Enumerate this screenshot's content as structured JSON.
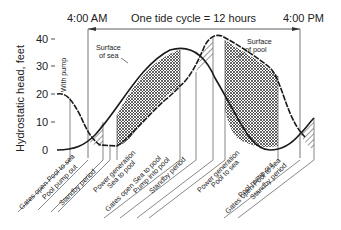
{
  "header": {
    "left_time": "4:00 AM",
    "cycle_label": "One tide cycle = 12 hours",
    "right_time": "4:00 PM"
  },
  "y_axis": {
    "label": "Hydrostatic head, feet",
    "ticks": [
      "40",
      "30",
      "20",
      "10",
      "0"
    ]
  },
  "annotations": {
    "with_pump": "With pump",
    "sea_surface_1": "Surface",
    "sea_surface_2": "of sea",
    "pool_surface_1": "Surface",
    "pool_surface_2": "of pool"
  },
  "phases": [
    {
      "label": "Gates open  Pool to sea"
    },
    {
      "label": "Pool pump out"
    },
    {
      "label": "Standby period"
    },
    {
      "label": "Power generation"
    },
    {
      "label": "Sea to pool"
    },
    {
      "label": "Gates open  Sea to pool"
    },
    {
      "label": "Pump into pool"
    },
    {
      "label": "Standby period"
    },
    {
      "label": "Power generation"
    },
    {
      "label": "Pool to sea"
    },
    {
      "label": "Gates open  Pool to sea"
    },
    {
      "label": "Pool pump out"
    },
    {
      "label": "Standby period"
    }
  ],
  "colors": {
    "line": "#1a1a1a",
    "guide": "#555555",
    "background": "#ffffff"
  }
}
